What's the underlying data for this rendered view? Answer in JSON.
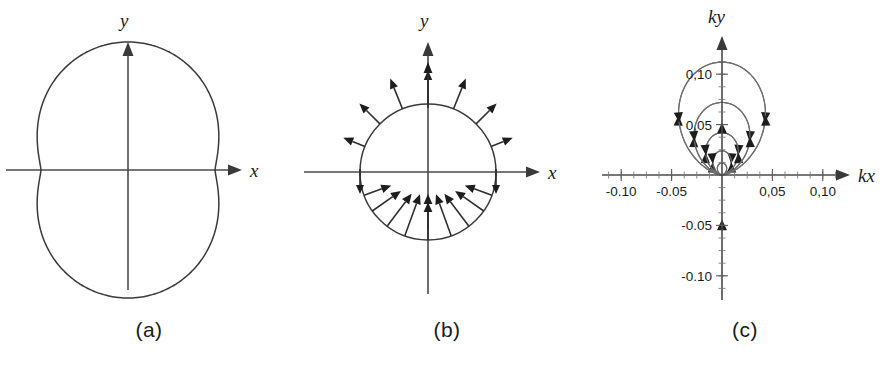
{
  "figure": {
    "background_color": "#ffffff",
    "curve_color": "#3a3a3a",
    "axis_color": "#4a4a4a",
    "fieldline_color": "#6e6e6e",
    "arrow_color": "#1d1d1d",
    "panel_count": 3
  },
  "panels": [
    {
      "id": "a",
      "caption": "(a)",
      "x_axis_label": "x",
      "y_axis_label": "y",
      "description": "peanut-shaped radiation pattern lobe"
    },
    {
      "id": "b",
      "caption": "(b)",
      "x_axis_label": "x",
      "y_axis_label": "y",
      "description": "circle with radial field vectors, outward above axis and inward below"
    },
    {
      "id": "c",
      "caption": "(c)",
      "x_axis_label": "kx",
      "y_axis_label": "ky",
      "description": "dipole field lines with direction arrowheads"
    }
  ],
  "chart_data": [
    {
      "type": "line",
      "panel": "a",
      "title": "",
      "xlabel": "x",
      "ylabel": "y",
      "grid": false,
      "legend": "none",
      "polar": true,
      "curve_form": "r(theta) = a*(1 - b*sin(2*theta)^2) elongated along y",
      "r_max_relative": 1.0,
      "r_waist_relative": 0.68,
      "theta_deg": [
        0,
        15,
        30,
        45,
        60,
        75,
        90,
        105,
        120,
        135,
        150,
        165,
        180,
        195,
        210,
        225,
        240,
        255,
        270,
        285,
        300,
        315,
        330,
        345,
        360
      ],
      "r_values": [
        0.68,
        0.7,
        0.78,
        0.9,
        0.98,
        1.0,
        1.0,
        1.0,
        0.98,
        0.9,
        0.78,
        0.7,
        0.68,
        0.7,
        0.78,
        0.9,
        0.98,
        1.0,
        1.0,
        1.0,
        0.98,
        0.9,
        0.78,
        0.7,
        0.68
      ]
    },
    {
      "type": "scatter",
      "panel": "b",
      "title": "",
      "xlabel": "x",
      "ylabel": "y",
      "grid": false,
      "legend": "none",
      "polar": true,
      "base_curve": "circle of constant radius",
      "circle_radius_relative": 1.0,
      "vector_count": 17,
      "vector_angles_deg": [
        0,
        22,
        45,
        68,
        90,
        112,
        135,
        158,
        180,
        200,
        215,
        233,
        250,
        270,
        290,
        307,
        325,
        340
      ],
      "upper_half_direction": "outward (away from origin)",
      "lower_half_direction": "inward (toward origin)",
      "axis_vectors": [
        "upward arrow on +y axis",
        "upward arrow at bottom of circle on -y axis"
      ]
    },
    {
      "type": "line",
      "panel": "c",
      "title": "",
      "xlabel": "kx",
      "ylabel": "ky",
      "grid": false,
      "legend": "none",
      "field": "electric dipole field lines, dipole oriented along y",
      "xlim": [
        -0.125,
        0.125
      ],
      "ylim": [
        -0.125,
        0.125
      ],
      "xticks": [
        -0.1,
        -0.05,
        0.05,
        0.1
      ],
      "xticklabels": [
        "-0.10",
        "-0.05",
        "0,05",
        "0,10"
      ],
      "yticks": [
        -0.1,
        -0.05,
        0.05,
        0.1
      ],
      "yticklabels": [
        "-0.10",
        "-0.05",
        "0,05",
        "0,10"
      ],
      "minor_tick_interval": 0.0125,
      "loop_scales": [
        0.012,
        0.024,
        0.042,
        0.072,
        0.112
      ],
      "open_lines": "four lines escaping to the four corners",
      "arrow_direction": "counterclockwise on the left lobes, clockwise on the right lobes"
    }
  ]
}
